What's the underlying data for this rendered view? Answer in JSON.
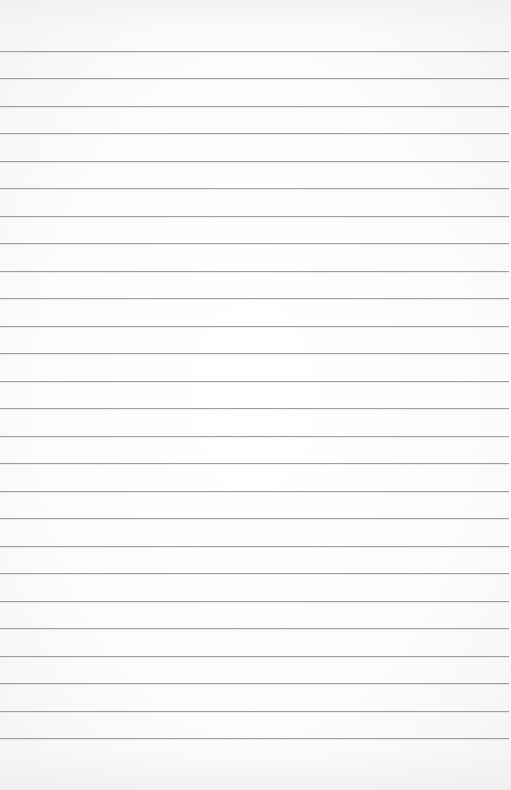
{
  "document": {
    "type": "blank ruled paper",
    "background_color": "#fbfbfb",
    "rule_color": "#9e9e9e",
    "rule_count": 26,
    "first_rule_y": 51,
    "rule_spacing": 27.48,
    "rule_width": 509,
    "text_content": ""
  }
}
